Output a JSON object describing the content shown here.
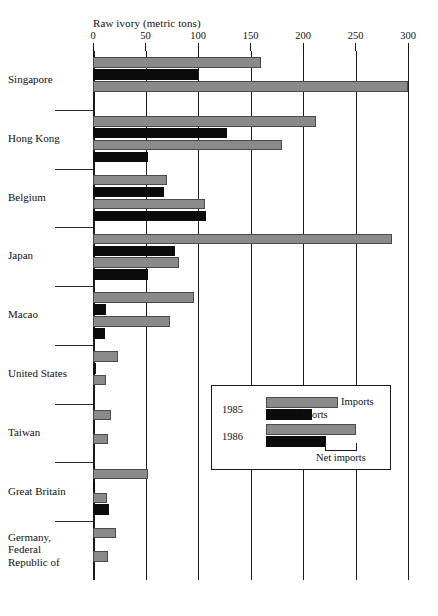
{
  "chart_data": {
    "type": "bar",
    "orientation": "horizontal",
    "title": "Raw ivory (metric tons)",
    "xlabel": "Raw ivory (metric tons)",
    "ylabel": "",
    "xlim": [
      0,
      300
    ],
    "xticks": [
      0,
      50,
      100,
      150,
      200,
      250,
      300
    ],
    "xtick_labels": [
      "0",
      "50",
      "100",
      "150",
      "200",
      "250",
      "300"
    ],
    "grid": true,
    "grid_axis": "x",
    "legend_position": "inside-lower-right",
    "categories": [
      "Singapore",
      "Hong Kong",
      "Belgium",
      "Japan",
      "Macao",
      "United States",
      "Taiwan",
      "Great Britain",
      "Germany, Federal Republic of"
    ],
    "series": [
      {
        "name": "1985 Imports",
        "year": "1985",
        "flow": "Imports",
        "color": "#8a8a8a",
        "values": [
          160,
          212,
          70,
          285,
          96,
          24,
          17,
          52,
          22
        ]
      },
      {
        "name": "1985 Exports",
        "year": "1985",
        "flow": "Exports",
        "color": "#0b0b0b",
        "values": [
          100,
          128,
          68,
          78,
          12,
          3,
          0,
          2,
          0
        ]
      },
      {
        "name": "1986 Imports",
        "year": "1986",
        "flow": "Imports",
        "color": "#8a8a8a",
        "values": [
          300,
          180,
          107,
          82,
          73,
          12,
          14,
          13,
          14
        ]
      },
      {
        "name": "1986 Exports",
        "year": "1986",
        "flow": "Exports",
        "color": "#0b0b0b",
        "values": [
          0,
          52,
          108,
          52,
          11,
          0,
          0,
          15,
          0
        ]
      }
    ],
    "legend": {
      "rows": [
        {
          "year": "1985",
          "imports_label": "Imports",
          "exports_label": "Exports"
        },
        {
          "year": "1986",
          "imports_label": "",
          "exports_label": ""
        }
      ],
      "annotation": "Net imports"
    }
  },
  "axis": {
    "title": "Raw ivory (metric tons)",
    "ticks": [
      "0",
      "50",
      "100",
      "150",
      "200",
      "250",
      "300"
    ]
  },
  "countries": [
    {
      "label": "Singapore"
    },
    {
      "label": "Hong Kong"
    },
    {
      "label": "Belgium"
    },
    {
      "label": "Japan"
    },
    {
      "label": "Macao"
    },
    {
      "label": "United States"
    },
    {
      "label": "Taiwan"
    },
    {
      "label": "Great Britain"
    },
    {
      "label": "Germany,\nFederal\nRepublic of"
    }
  ],
  "legend": {
    "year_1985": "1985",
    "year_1986": "1986",
    "imports_label": "Imports",
    "exports_label": "Exports",
    "net_imports_label": "Net imports"
  },
  "colors": {
    "imports": "#8a8a8a",
    "exports": "#0b0b0b",
    "axis": "#1a1a1a",
    "background": "#ffffff"
  }
}
